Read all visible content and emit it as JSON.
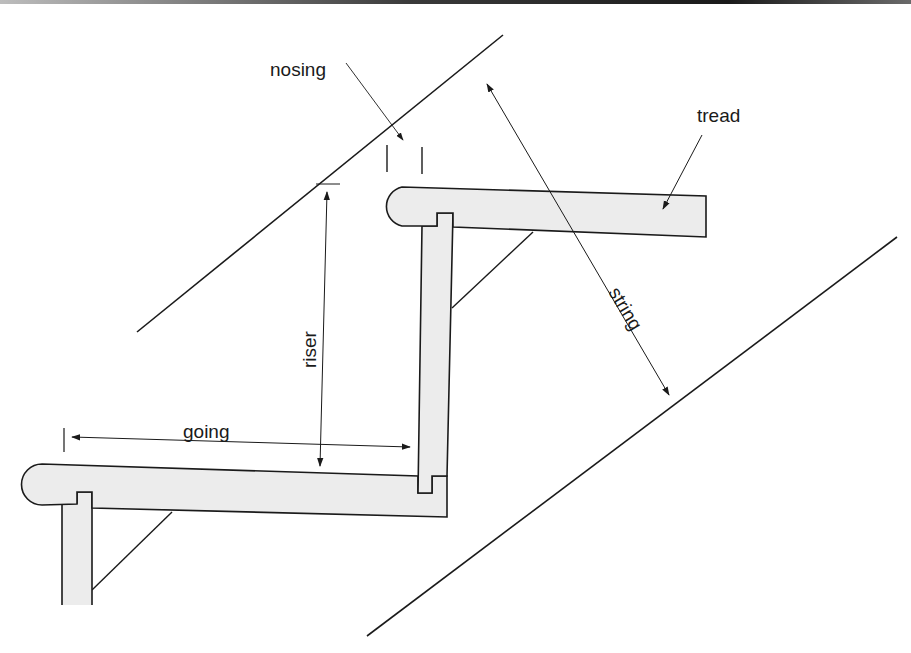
{
  "diagram": {
    "labels": {
      "nosing": "nosing",
      "tread": "tread",
      "string": "string",
      "riser": "riser",
      "going": "going"
    },
    "colors": {
      "line": "#1a1a1a",
      "timber_fill": "#ececec",
      "background": "#ffffff"
    }
  }
}
